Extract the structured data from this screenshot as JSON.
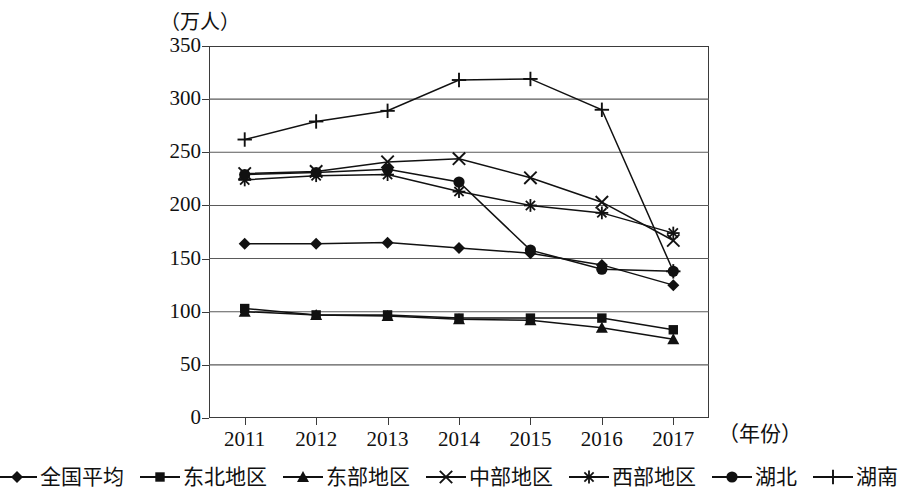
{
  "chart_data": {
    "type": "line",
    "title": "",
    "subtitle": "",
    "ylabel": "（万人）",
    "xlabel": "（年份）",
    "categories": [
      "2011",
      "2012",
      "2013",
      "2014",
      "2015",
      "2016",
      "2017"
    ],
    "x": [
      2011,
      2012,
      2013,
      2014,
      2015,
      2016,
      2017
    ],
    "ylim": [
      0,
      350
    ],
    "yticks": [
      0,
      50,
      100,
      150,
      200,
      250,
      300,
      350
    ],
    "grid": true,
    "grid_axis": "y",
    "legend_position": "bottom",
    "series": [
      {
        "name": "全国平均",
        "marker": "diamond",
        "values": [
          164,
          164,
          165,
          160,
          155,
          144,
          125
        ]
      },
      {
        "name": "东北地区",
        "marker": "square",
        "values": [
          103,
          97,
          97,
          94,
          94,
          94,
          83
        ]
      },
      {
        "name": "东部地区",
        "marker": "triangle",
        "values": [
          100,
          97,
          96,
          93,
          92,
          85,
          74
        ]
      },
      {
        "name": "中部地区",
        "marker": "cross",
        "values": [
          230,
          232,
          241,
          244,
          226,
          203,
          167
        ]
      },
      {
        "name": "西部地区",
        "marker": "asterisk",
        "values": [
          224,
          228,
          229,
          213,
          200,
          193,
          174
        ]
      },
      {
        "name": "湖北",
        "marker": "circle",
        "values": [
          229,
          231,
          234,
          222,
          158,
          140,
          138
        ]
      },
      {
        "name": "湖南",
        "marker": "plus",
        "values": [
          262,
          279,
          289,
          318,
          319,
          290,
          138
        ]
      }
    ]
  },
  "colors": {
    "ink": "#111111",
    "axis": "#3b3b3b",
    "grid": "#5a5a5a",
    "background": "#ffffff"
  }
}
